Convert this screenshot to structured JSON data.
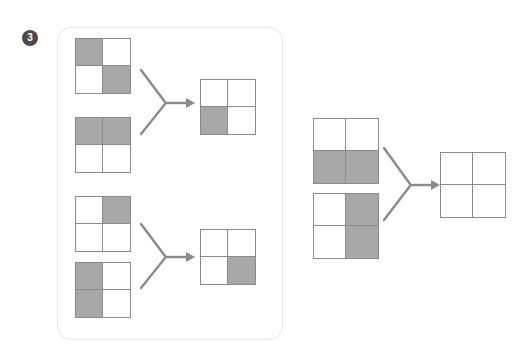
{
  "page": {
    "question_number": "3",
    "width": 518,
    "height": 355,
    "background_color": "#ffffff"
  },
  "colors": {
    "shaded_cell": "#a8a8a8",
    "empty_cell": "#ffffff",
    "grid_border": "#8a8a8a",
    "arrow": "#8a8a8a",
    "panel_border": "#e6e6e6",
    "badge_background": "#4a4a4a",
    "badge_text": "#ffffff"
  },
  "legend": {
    "cell_state_shaded": "shaded",
    "cell_state_empty": "empty",
    "grid_rows": 2,
    "grid_columns": 2
  },
  "example_panel": {
    "name": "worked-examples-panel",
    "examples": [
      {
        "id": "example-1",
        "input_top": {
          "name": "grid-example1-input-top",
          "cells": [
            "shaded",
            "empty",
            "empty",
            "shaded"
          ]
        },
        "input_bottom": {
          "name": "grid-example1-input-bottom",
          "cells": [
            "shaded",
            "shaded",
            "empty",
            "empty"
          ]
        },
        "arrow": {
          "name": "merge-arrow-example1",
          "direction": "right"
        },
        "output": {
          "name": "grid-example1-output",
          "cells": [
            "empty",
            "empty",
            "shaded",
            "empty"
          ]
        }
      },
      {
        "id": "example-2",
        "input_top": {
          "name": "grid-example2-input-top",
          "cells": [
            "empty",
            "shaded",
            "empty",
            "empty"
          ]
        },
        "input_bottom": {
          "name": "grid-example2-input-bottom",
          "cells": [
            "shaded",
            "empty",
            "shaded",
            "empty"
          ]
        },
        "arrow": {
          "name": "merge-arrow-example2",
          "direction": "right"
        },
        "output": {
          "name": "grid-example2-output",
          "cells": [
            "empty",
            "empty",
            "empty",
            "shaded"
          ]
        }
      }
    ]
  },
  "question": {
    "name": "question-problem",
    "input_top": {
      "name": "grid-question-input-top",
      "cells": [
        "empty",
        "empty",
        "shaded",
        "shaded"
      ]
    },
    "input_bottom": {
      "name": "grid-question-input-bottom",
      "cells": [
        "empty",
        "shaded",
        "empty",
        "shaded"
      ]
    },
    "arrow": {
      "name": "merge-arrow-question",
      "direction": "right"
    },
    "output": {
      "name": "grid-question-output-blank",
      "cells": [
        "empty",
        "empty",
        "empty",
        "empty"
      ]
    }
  }
}
